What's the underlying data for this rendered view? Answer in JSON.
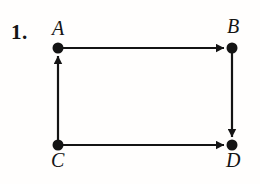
{
  "figure": {
    "problem_number": "1.",
    "background_color": "#fffefd",
    "ink_color": "#141414",
    "width": 260,
    "height": 184
  },
  "graph": {
    "type": "directed-graph",
    "node_radius": 5.5,
    "edge_width": 2.2,
    "nodes": [
      {
        "id": "A",
        "label": "A",
        "x": 58,
        "y": 48,
        "label_x": 52,
        "label_y": 18
      },
      {
        "id": "B",
        "label": "B",
        "x": 232,
        "y": 48,
        "label_x": 227,
        "label_y": 16
      },
      {
        "id": "C",
        "label": "C",
        "x": 58,
        "y": 145,
        "label_x": 51,
        "label_y": 150
      },
      {
        "id": "D",
        "label": "D",
        "x": 232,
        "y": 145,
        "label_x": 226,
        "label_y": 150
      }
    ],
    "edges": [
      {
        "id": "edge-a-b",
        "from": "A",
        "to": "B",
        "direction": "right",
        "arrowhead": "at-target"
      },
      {
        "id": "edge-c-a",
        "from": "C",
        "to": "A",
        "direction": "up",
        "arrowhead": "at-target"
      },
      {
        "id": "edge-b-d",
        "from": "B",
        "to": "D",
        "direction": "down",
        "arrowhead": "at-target"
      },
      {
        "id": "edge-c-d",
        "from": "C",
        "to": "D",
        "direction": "right",
        "arrowhead": "at-target"
      }
    ]
  }
}
